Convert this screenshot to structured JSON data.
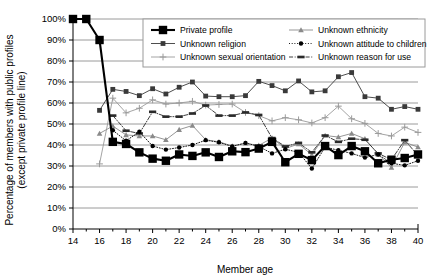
{
  "chart_data": {
    "type": "line",
    "title": "",
    "xlabel": "Member age",
    "ylabel": "Percentage of members with public profiles (except private profile line)",
    "ylabel_line1": "Percentage of members with public profiles",
    "ylabel_line2": "(except private profile line)",
    "xlim": [
      14,
      40
    ],
    "ylim": [
      0,
      100
    ],
    "yticks": [
      "0%",
      "10%",
      "20%",
      "30%",
      "40%",
      "50%",
      "60%",
      "70%",
      "80%",
      "90%",
      "100%"
    ],
    "ytick_values": [
      0,
      10,
      20,
      30,
      40,
      50,
      60,
      70,
      80,
      90,
      100
    ],
    "xticks": [
      "14",
      "16",
      "18",
      "20",
      "22",
      "24",
      "26",
      "28",
      "30",
      "32",
      "34",
      "36",
      "38",
      "40"
    ],
    "xtick_values": [
      14,
      16,
      18,
      20,
      22,
      24,
      26,
      28,
      30,
      32,
      34,
      36,
      38,
      40
    ],
    "x": [
      14,
      15,
      16,
      17,
      18,
      19,
      20,
      21,
      22,
      23,
      24,
      25,
      26,
      27,
      28,
      29,
      30,
      31,
      32,
      33,
      34,
      35,
      36,
      37,
      38,
      39,
      40
    ],
    "grid": "horizontal",
    "legend_position": "top-center",
    "series": [
      {
        "name": "Private profile",
        "marker": "square-filled",
        "color": "#000000",
        "line_style": "solid",
        "line_width": 2.1,
        "marker_size": 4.2,
        "values": [
          100,
          100,
          90,
          41.5,
          40.5,
          36.5,
          33.5,
          32.5,
          35.5,
          34.8,
          36.5,
          34.3,
          37,
          36.6,
          38.3,
          41.5,
          31.8,
          35.8,
          32.8,
          39.5,
          35.2,
          39.5,
          37,
          31.3,
          33,
          33.8,
          35.5
        ]
      },
      {
        "name": "Unknown religion",
        "marker": "square-filled",
        "color": "#3a3a3a",
        "line_style": "solid",
        "line_width": 0.9,
        "marker_size": 2.4,
        "values": [
          null,
          null,
          56.5,
          66.5,
          65.5,
          63.5,
          66.8,
          64.3,
          67.5,
          70,
          63.3,
          63,
          63,
          63.5,
          70.3,
          68.3,
          65.8,
          70.5,
          65.3,
          65.8,
          72.5,
          74.5,
          63,
          62.3,
          57,
          58.3,
          57
        ]
      },
      {
        "name": "Unknown sexual orientation",
        "marker": "plus-small",
        "color": "#9a9a9a",
        "line_style": "solid",
        "line_width": 0.9,
        "marker_size": 2.4,
        "values": [
          null,
          null,
          31,
          62.3,
          55.3,
          57.5,
          61.5,
          59.5,
          60,
          60.8,
          59,
          59.3,
          59.5,
          55.5,
          54,
          51.5,
          53,
          52,
          50.5,
          53,
          58.5,
          52.5,
          50.3,
          45.5,
          44.3,
          48.5,
          46
        ]
      },
      {
        "name": "Unknown ethnicity",
        "marker": "triangle-filled",
        "color": "#8a8a8a",
        "line_style": "solid",
        "line_width": 0.9,
        "marker_size": 2.8,
        "values": [
          null,
          null,
          45.5,
          49,
          44.8,
          44.3,
          44.3,
          42.5,
          47.3,
          49.3,
          42.5,
          41.5,
          39.5,
          40.8,
          39.8,
          43.3,
          38.3,
          40.5,
          35.3,
          44.5,
          43.8,
          45.5,
          43,
          35.5,
          29.3,
          41.3,
          39
        ]
      },
      {
        "name": "Unknown attitude to children",
        "marker": "circle-filled",
        "color": "#000000",
        "line_style": "dotted",
        "line_width": 0.9,
        "marker_size": 2.2,
        "values": [
          null,
          null,
          null,
          47,
          42,
          46.3,
          39.5,
          37.8,
          38.8,
          40,
          42.3,
          41.3,
          39.3,
          41,
          39.3,
          36,
          38,
          36.5,
          28.8,
          39,
          37.5,
          36,
          34,
          35.5,
          31.3,
          30.3,
          32.5
        ]
      },
      {
        "name": "Unknown reason for use",
        "marker": "dash-filled",
        "color": "#2a2a2a",
        "line_style": "dash-dot",
        "line_width": 0.9,
        "marker_size": 2.4,
        "values": [
          null,
          null,
          null,
          54,
          46.8,
          45.5,
          55.8,
          53.5,
          53.5,
          55,
          58.8,
          54,
          54,
          55.5,
          54.3,
          43.3,
          39.3,
          41,
          36.5,
          44.5,
          41.5,
          43,
          42.5,
          36,
          33,
          42.3,
          35
        ]
      }
    ]
  },
  "legend": {
    "entries": [
      {
        "label": "Private profile"
      },
      {
        "label": "Unknown ethnicity"
      },
      {
        "label": "Unknown religion"
      },
      {
        "label": "Unknown attitude to children"
      },
      {
        "label": "Unknown sexual orientation"
      },
      {
        "label": "Unknown reason for use"
      }
    ]
  }
}
